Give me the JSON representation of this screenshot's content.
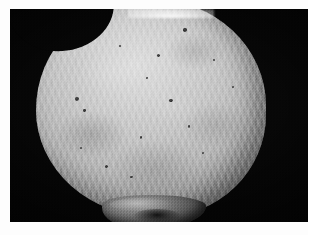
{
  "page": {
    "background_color": "#fdfdfd",
    "width": 312,
    "height": 235
  },
  "plate": {
    "name": "specimen-photograph",
    "background_color": "#020202",
    "left": 10,
    "top": 9,
    "width": 298,
    "height": 213,
    "caption": ""
  },
  "specimen": {
    "description": "Rounded pale ovoid specimen photographed against a black background",
    "surface": "fibrous radiating striations with mottled light and dark patches",
    "highlight_color": "#dedede",
    "midtone_color": "#b6b6b6",
    "shadow_color": "#5d5d5d",
    "features": {
      "notch_upper_left": "shallow concave indentation on the superior-left margin",
      "protrusion_inferior": "dark irregular process projecting from the inferior-central margin",
      "top_flare": "bright specular highlight where the specimen meets the upper frame edge"
    },
    "foramina": [
      {
        "left": 64.0,
        "top": 13.5,
        "size": 3.4
      },
      {
        "left": 52.5,
        "top": 25.0,
        "size": 3.0
      },
      {
        "left": 77.0,
        "top": 27.5,
        "size": 2.4
      },
      {
        "left": 36.0,
        "top": 21.0,
        "size": 2.2
      },
      {
        "left": 17.0,
        "top": 45.0,
        "size": 4.2
      },
      {
        "left": 20.5,
        "top": 50.5,
        "size": 2.6
      },
      {
        "left": 58.0,
        "top": 46.0,
        "size": 3.2
      },
      {
        "left": 45.0,
        "top": 63.0,
        "size": 2.6
      },
      {
        "left": 66.0,
        "top": 58.0,
        "size": 2.2
      },
      {
        "left": 30.0,
        "top": 76.0,
        "size": 3.0
      },
      {
        "left": 41.0,
        "top": 81.0,
        "size": 2.4
      },
      {
        "left": 19.0,
        "top": 68.0,
        "size": 2.0
      },
      {
        "left": 72.0,
        "top": 70.0,
        "size": 2.0
      },
      {
        "left": 48.0,
        "top": 36.0,
        "size": 1.8
      },
      {
        "left": 85.0,
        "top": 40.0,
        "size": 2.0
      }
    ]
  }
}
